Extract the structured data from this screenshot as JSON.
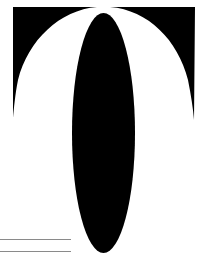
{
  "graphic": {
    "description": "abstract-black-shapes",
    "colors": {
      "background": "#ffffff",
      "shape": "#000000",
      "rule": "#8a8a8a"
    },
    "rules": [
      {
        "y": 239,
        "x1": 0,
        "x2": 71
      },
      {
        "y": 251,
        "x1": 0,
        "x2": 71
      }
    ]
  }
}
